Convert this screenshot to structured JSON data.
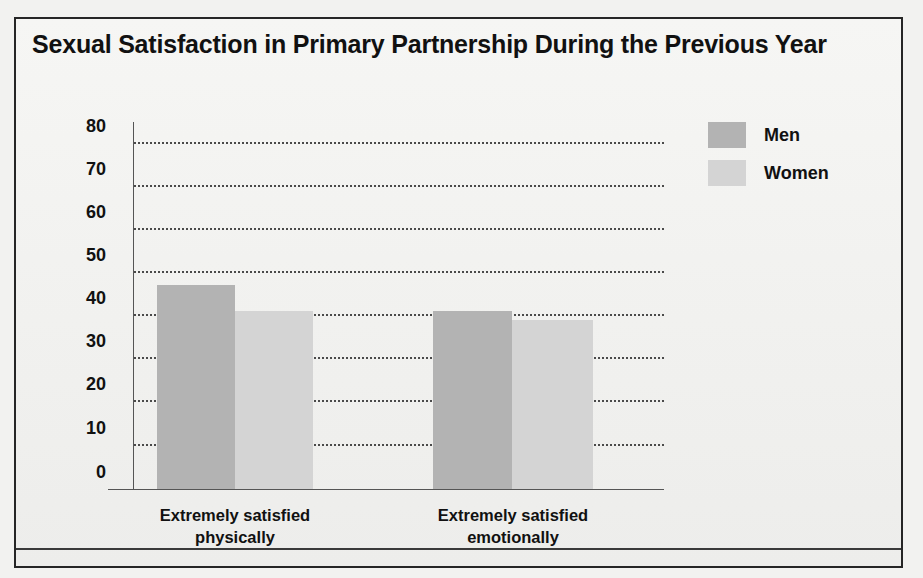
{
  "chart_data": {
    "type": "bar",
    "title": "Sexual Satisfaction in Primary Partnership During the Previous Year",
    "xlabel": "",
    "ylabel": "",
    "categories": [
      "Extremely satisfied physically",
      "Extremely satisfied emotionally"
    ],
    "category_lines": [
      [
        "Extremely satisfied",
        "physically"
      ],
      [
        "Extremely satisfied",
        "emotionally"
      ]
    ],
    "series": [
      {
        "name": "Men",
        "color": "#b3b3b3",
        "values": [
          47,
          41
        ]
      },
      {
        "name": "Women",
        "color": "#d4d4d4",
        "values": [
          41,
          39
        ]
      }
    ],
    "ylim": [
      0,
      80
    ],
    "yticks": [
      80,
      70,
      60,
      50,
      40,
      30,
      20,
      10,
      0
    ],
    "ytick_labels": [
      "80",
      "70",
      "60",
      "50",
      "40",
      "30",
      "20",
      "10",
      "0"
    ],
    "grid": "horizontal-dotted",
    "legend_position": "top-right",
    "annotations": []
  },
  "legend": {
    "entries": [
      {
        "label": "Men",
        "color": "#b3b3b3"
      },
      {
        "label": "Women",
        "color": "#d4d4d4"
      }
    ]
  },
  "colors": {
    "men": "#b3b3b3",
    "women": "#d4d4d4",
    "frame": "#262626",
    "text": "#111111",
    "grid": "#4a4a4a",
    "background": "#f4f4f2"
  }
}
